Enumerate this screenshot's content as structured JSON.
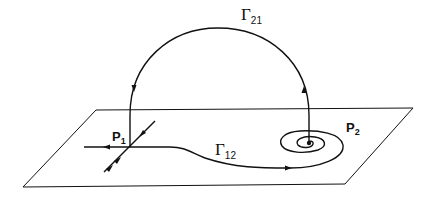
{
  "diagram": {
    "labels": {
      "p1": {
        "main": "P",
        "sub": "1"
      },
      "p2": {
        "main": "P",
        "sub": "2"
      },
      "gamma21": {
        "main": "Γ",
        "sub": "21"
      },
      "gamma12": {
        "main": "Γ",
        "sub": "12"
      }
    },
    "colors": {
      "stroke": "#111111",
      "background": "#ffffff"
    }
  }
}
